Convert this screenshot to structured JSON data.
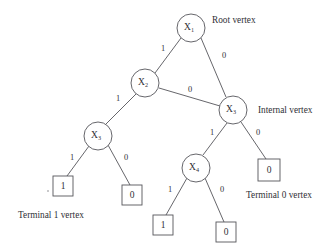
{
  "diagram": {
    "type": "binary-decision-diagram",
    "title": "",
    "canvas": {
      "width": 334,
      "height": 248,
      "background": "#ffffff"
    },
    "stroke_color": "#55555a",
    "text_color": "#303036",
    "nodes": [
      {
        "id": "n1",
        "kind": "internal",
        "role": "root",
        "label": "X",
        "sub": "1",
        "cx": 191,
        "cy": 28,
        "r": 14
      },
      {
        "id": "n2",
        "kind": "internal",
        "role": "internal",
        "label": "X",
        "sub": "2",
        "cx": 145,
        "cy": 83,
        "r": 14
      },
      {
        "id": "n3",
        "kind": "internal",
        "role": "internal",
        "label": "X",
        "sub": "3",
        "cx": 233,
        "cy": 110,
        "r": 14
      },
      {
        "id": "n4",
        "kind": "internal",
        "role": "internal",
        "label": "X",
        "sub": "3",
        "cx": 98,
        "cy": 136,
        "r": 14
      },
      {
        "id": "n5",
        "kind": "internal",
        "role": "internal",
        "label": "X",
        "sub": "4",
        "cx": 196,
        "cy": 168,
        "r": 14
      }
    ],
    "terminals": [
      {
        "id": "t1",
        "value": "1",
        "x": 53,
        "y": 176,
        "w": 20,
        "h": 20
      },
      {
        "id": "t2",
        "value": "0",
        "x": 122,
        "y": 185,
        "w": 20,
        "h": 20
      },
      {
        "id": "t3",
        "value": "1",
        "x": 153,
        "y": 215,
        "w": 20,
        "h": 20
      },
      {
        "id": "t4",
        "value": "0",
        "x": 216,
        "y": 222,
        "w": 20,
        "h": 20
      },
      {
        "id": "t5",
        "value": "0",
        "x": 258,
        "y": 159,
        "w": 22,
        "h": 22
      }
    ],
    "edges": [
      {
        "from": "n1",
        "to": "n2",
        "label": "1",
        "x1": 181,
        "y1": 38,
        "x2": 155,
        "y2": 73,
        "lx": 163,
        "ly": 49
      },
      {
        "from": "n1",
        "to": "n3",
        "label": "0",
        "x1": 201,
        "y1": 38,
        "x2": 226,
        "y2": 97,
        "lx": 224,
        "ly": 56
      },
      {
        "from": "n2",
        "to": "n4",
        "label": "1",
        "x1": 136,
        "y1": 94,
        "x2": 106,
        "y2": 124,
        "lx": 118,
        "ly": 99
      },
      {
        "from": "n2",
        "to": "n3",
        "label": "0",
        "x1": 159,
        "y1": 88,
        "x2": 220,
        "y2": 106,
        "lx": 190,
        "ly": 90
      },
      {
        "from": "n3",
        "to": "n5",
        "label": "1",
        "x1": 227,
        "y1": 123,
        "x2": 203,
        "y2": 155,
        "lx": 212,
        "ly": 133
      },
      {
        "from": "n3",
        "to": "t5",
        "label": "0",
        "x1": 241,
        "y1": 122,
        "x2": 266,
        "y2": 159,
        "lx": 258,
        "ly": 133
      },
      {
        "from": "n4",
        "to": "t1",
        "label": "1",
        "x1": 89,
        "y1": 146,
        "x2": 67,
        "y2": 176,
        "lx": 72,
        "ly": 158
      },
      {
        "from": "n4",
        "to": "t2",
        "label": "0",
        "x1": 108,
        "y1": 145,
        "x2": 130,
        "y2": 185,
        "lx": 126,
        "ly": 158
      },
      {
        "from": "n5",
        "to": "t3",
        "label": "1",
        "x1": 187,
        "y1": 178,
        "x2": 166,
        "y2": 215,
        "lx": 170,
        "ly": 190
      },
      {
        "from": "n5",
        "to": "t4",
        "label": "0",
        "x1": 205,
        "y1": 178,
        "x2": 224,
        "y2": 222,
        "lx": 222,
        "ly": 190
      }
    ],
    "annotations": [
      {
        "id": "a1",
        "text": "Root vertex",
        "x": 212,
        "y": 21,
        "anchor": "start"
      },
      {
        "id": "a2",
        "text": "Internal vertex",
        "x": 258,
        "y": 111,
        "anchor": "start"
      },
      {
        "id": "a3",
        "text": "Terminal 0 vertex",
        "x": 246,
        "y": 196,
        "anchor": "start"
      },
      {
        "id": "a4",
        "text": "Terminal 1 vertex",
        "x": 18,
        "y": 216,
        "anchor": "start"
      }
    ]
  }
}
